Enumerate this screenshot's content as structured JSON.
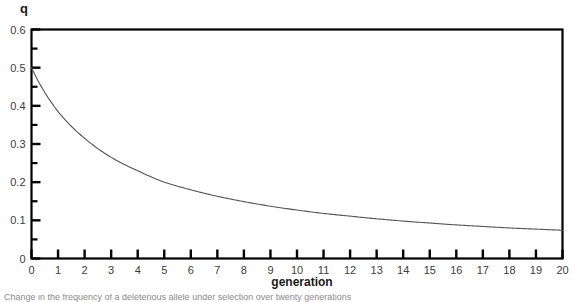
{
  "axis_titles": {
    "y": "q",
    "x": "generation"
  },
  "caption": {
    "text": "Change in the frequency of a deleterious allele under selection over twenty generations"
  },
  "colors": {
    "axis": "#000000",
    "curve": "#555555",
    "tick_label": "#3c3c3c",
    "background": "#ffffff"
  },
  "chart_data": {
    "type": "line",
    "title": "",
    "xlabel": "generation",
    "ylabel": "q",
    "xlim": [
      0,
      20
    ],
    "ylim": [
      0,
      0.6
    ],
    "grid": false,
    "legend": "none",
    "y_major_ticks": [
      0,
      0.1,
      0.2,
      0.3,
      0.4,
      0.5,
      0.6
    ],
    "y_tick_labels": [
      "0",
      "0.1",
      "0.2",
      "0.3",
      "0.4",
      "0.5",
      "0.6"
    ],
    "y_minor_ticks": [
      0.05,
      0.15,
      0.25,
      0.35,
      0.45,
      0.55
    ],
    "x_ticks": [
      0,
      1,
      2,
      3,
      4,
      5,
      6,
      7,
      8,
      9,
      10,
      11,
      12,
      13,
      14,
      15,
      16,
      17,
      18,
      19,
      20
    ],
    "x_tick_labels": [
      "0",
      "1",
      "2",
      "3",
      "4",
      "5",
      "6",
      "7",
      "8",
      "9",
      "10",
      "11",
      "12",
      "13",
      "14",
      "15",
      "16",
      "17",
      "18",
      "19",
      "20"
    ],
    "series": [
      {
        "name": "q",
        "x": [
          0,
          1,
          2,
          3,
          4,
          5,
          6,
          7,
          8,
          9,
          10,
          11,
          12,
          13,
          14,
          15,
          16,
          17,
          18,
          19,
          20
        ],
        "values": [
          0.5,
          0.385,
          0.315,
          0.265,
          0.23,
          0.2,
          0.18,
          0.163,
          0.149,
          0.137,
          0.127,
          0.118,
          0.111,
          0.104,
          0.098,
          0.093,
          0.088,
          0.084,
          0.08,
          0.077,
          0.074
        ]
      }
    ]
  }
}
